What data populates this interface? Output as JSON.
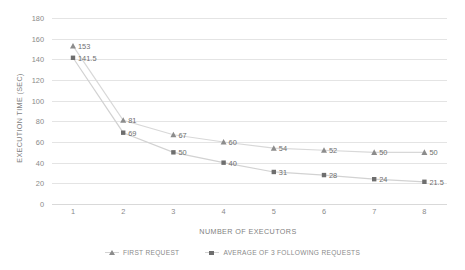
{
  "chart_data": {
    "type": "line",
    "title": "",
    "xlabel": "NUMBER OF EXECUTORS",
    "ylabel": "EXECUTION TIME (SEC)",
    "x": [
      1,
      2,
      3,
      4,
      5,
      6,
      7,
      8
    ],
    "categories": [
      "1",
      "2",
      "3",
      "4",
      "5",
      "6",
      "7",
      "8"
    ],
    "xlim": [
      1,
      8
    ],
    "ylim": [
      0,
      180
    ],
    "y_ticks": [
      0,
      20,
      40,
      60,
      80,
      100,
      120,
      140,
      160,
      180
    ],
    "y_tick_labels": [
      "0",
      "20",
      "40",
      "60",
      "80",
      "100",
      "120",
      "140",
      "160",
      "180"
    ],
    "grid": true,
    "legend_position": "bottom",
    "series": [
      {
        "name": "FIRST REQUEST",
        "marker": "triangle",
        "color": "#8c8c8c",
        "line_color": "#d8d8d8",
        "values": [
          153,
          81,
          67,
          60,
          54,
          52,
          50,
          50
        ],
        "labels": [
          "153",
          "81",
          "67",
          "60",
          "54",
          "52",
          "50",
          "50"
        ]
      },
      {
        "name": "AVERAGE OF 3 FOLLOWING REQUESTS",
        "marker": "square",
        "color": "#6e6e6e",
        "line_color": "#d2d2d2",
        "values": [
          141.5,
          69,
          50,
          40,
          31,
          28,
          24,
          21.5
        ],
        "labels": [
          "141.5",
          "69",
          "50",
          "40",
          "31",
          "28",
          "24",
          "21.5"
        ]
      }
    ]
  },
  "legend": {
    "items": [
      {
        "label": "FIRST REQUEST",
        "marker": "triangle"
      },
      {
        "label": "AVERAGE OF 3 FOLLOWING REQUESTS",
        "marker": "square"
      }
    ]
  },
  "colors": {
    "gridline": "#e4e4e4",
    "text": "#8a8a8a",
    "marker_first": "#8c8c8c",
    "marker_avg": "#6e6e6e"
  }
}
